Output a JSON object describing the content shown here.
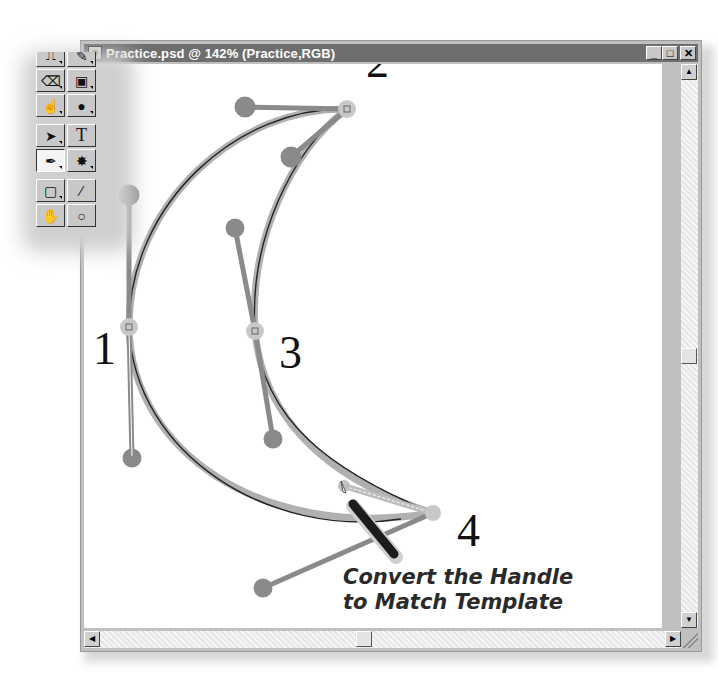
{
  "window": {
    "title": "Practice.psd @ 142% (Practice,RGB)",
    "controls": {
      "minimize": "_",
      "maximize": "□",
      "close": "✕"
    },
    "scrollbars": {
      "up": "▲",
      "down": "▼",
      "left": "◀",
      "right": "▶"
    }
  },
  "toolbox": {
    "tools": [
      {
        "name": "stamp-tool",
        "glyph": "⎍"
      },
      {
        "name": "history-brush-tool",
        "glyph": "✎"
      },
      {
        "name": "eraser-tool",
        "glyph": "⌫"
      },
      {
        "name": "gradient-tool",
        "glyph": "▣"
      },
      {
        "name": "smudge-tool",
        "glyph": "☝"
      },
      {
        "name": "dodge-tool",
        "glyph": "●"
      },
      {
        "name": "path-selection-tool",
        "glyph": "➤"
      },
      {
        "name": "type-tool",
        "glyph": "T"
      },
      {
        "name": "pen-tool",
        "glyph": "✒"
      },
      {
        "name": "shape-tool",
        "glyph": "✸"
      },
      {
        "name": "notes-tool",
        "glyph": "▢"
      },
      {
        "name": "eyedropper-tool",
        "glyph": "⁄"
      },
      {
        "name": "hand-tool",
        "glyph": "✋"
      },
      {
        "name": "zoom-tool",
        "glyph": "○"
      }
    ]
  },
  "canvas": {
    "point_labels": [
      "1",
      "2",
      "3",
      "4"
    ],
    "caption_line1": "Convert the Handle",
    "caption_line2": "to Match Template",
    "colors": {
      "template": "#a9a9a9",
      "handle": "#8a8a8a",
      "path": "#222222",
      "anchor": "#c4c4c4"
    }
  }
}
